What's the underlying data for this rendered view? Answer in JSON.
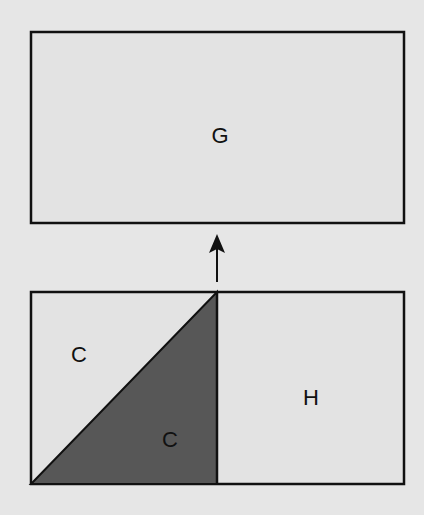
{
  "diagram": {
    "top_box": {
      "label": "G"
    },
    "arrow": {
      "direction": "up"
    },
    "bottom_box": {
      "left_square": {
        "upper_triangle_label": "C",
        "lower_triangle_label": "C"
      },
      "right_square": {
        "label": "H"
      }
    },
    "colors": {
      "background": "#e6e6e6",
      "box_fill": "#e3e3e3",
      "shaded_triangle": "#575757",
      "stroke": "#111111"
    }
  }
}
